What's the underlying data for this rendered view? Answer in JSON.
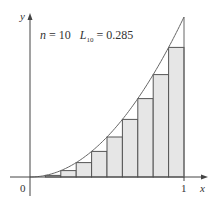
{
  "chart_data": {
    "type": "bar",
    "title": "",
    "function": "y = x^2",
    "method": "left endpoint Riemann sum",
    "n": 10,
    "annotation": {
      "n_label": "n = 10",
      "sum_label": "L",
      "sum_subscript": "10",
      "sum_value": "= 0.285"
    },
    "categories": [
      "0.0",
      "0.1",
      "0.2",
      "0.3",
      "0.4",
      "0.5",
      "0.6",
      "0.7",
      "0.8",
      "0.9"
    ],
    "values": [
      0,
      0.01,
      0.04,
      0.09,
      0.16,
      0.25,
      0.36,
      0.49,
      0.64,
      0.81
    ],
    "curve": {
      "x": [
        0,
        0.1,
        0.2,
        0.3,
        0.4,
        0.5,
        0.6,
        0.7,
        0.8,
        0.9,
        1.0
      ],
      "y": [
        0,
        0.01,
        0.04,
        0.09,
        0.16,
        0.25,
        0.36,
        0.49,
        0.64,
        0.81,
        1.0
      ]
    },
    "xlabel": "x",
    "ylabel": "y",
    "xticks": [
      "0",
      "1"
    ],
    "xlim": [
      0,
      1.1
    ],
    "ylim": [
      0,
      1.05
    ],
    "grid": false,
    "colors": {
      "bar_fill": "#e6e6e6",
      "bar_stroke": "#555555",
      "curve": "#666666",
      "axis": "#444444"
    }
  },
  "labels": {
    "origin": "0",
    "x_one": "1",
    "x_axis": "x",
    "y_axis": "y",
    "n_part": "n",
    "n_eq": " = 10",
    "L": "L",
    "L_sub": "10",
    "L_eq": " = 0.285"
  }
}
